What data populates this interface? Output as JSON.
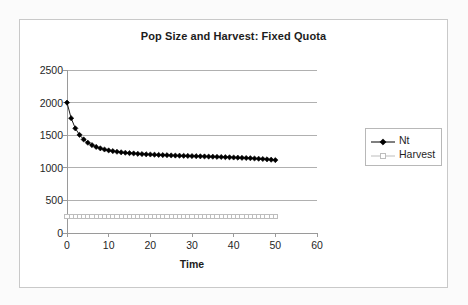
{
  "chart_data": {
    "type": "line",
    "title": "Pop Size and Harvest: Fixed Quota",
    "xlabel": "Time",
    "ylabel": "",
    "xlim": [
      0,
      60
    ],
    "ylim": [
      0,
      2500
    ],
    "xticks": [
      0,
      10,
      20,
      30,
      40,
      50,
      60
    ],
    "yticks": [
      0,
      500,
      1000,
      1500,
      2000,
      2500
    ],
    "grid": "horizontal",
    "legend_position": "right",
    "x": [
      0,
      1,
      2,
      3,
      4,
      5,
      6,
      7,
      8,
      9,
      10,
      11,
      12,
      13,
      14,
      15,
      16,
      17,
      18,
      19,
      20,
      21,
      22,
      23,
      24,
      25,
      26,
      27,
      28,
      29,
      30,
      31,
      32,
      33,
      34,
      35,
      36,
      37,
      38,
      39,
      40,
      41,
      42,
      43,
      44,
      45,
      46,
      47,
      48,
      49,
      50
    ],
    "series": [
      {
        "name": "Nt",
        "marker": "filled-diamond",
        "color": "#000000",
        "values": [
          2000,
          1760,
          1605,
          1505,
          1435,
          1385,
          1348,
          1320,
          1298,
          1281,
          1267,
          1256,
          1246,
          1238,
          1231,
          1225,
          1220,
          1215,
          1211,
          1207,
          1204,
          1201,
          1198,
          1195,
          1193,
          1190,
          1188,
          1186,
          1184,
          1182,
          1180,
          1178,
          1176,
          1174,
          1172,
          1170,
          1168,
          1166,
          1163,
          1161,
          1158,
          1156,
          1153,
          1150,
          1147,
          1143,
          1139,
          1135,
          1130,
          1124,
          1118
        ]
      },
      {
        "name": "Harvest",
        "marker": "open-square",
        "color": "#bdbdbd",
        "values": [
          250,
          250,
          250,
          250,
          250,
          250,
          250,
          250,
          250,
          250,
          250,
          250,
          250,
          250,
          250,
          250,
          250,
          250,
          250,
          250,
          250,
          250,
          250,
          250,
          250,
          250,
          250,
          250,
          250,
          250,
          250,
          250,
          250,
          250,
          250,
          250,
          250,
          250,
          250,
          250,
          250,
          250,
          250,
          250,
          250,
          250,
          250,
          250,
          250,
          250,
          250
        ]
      }
    ]
  },
  "legend": {
    "entries": [
      {
        "label": "Nt"
      },
      {
        "label": "Harvest"
      }
    ]
  },
  "colors": {
    "series_nt": "#000000",
    "series_harvest": "#bdbdbd",
    "gridline": "#b0b0b0",
    "axis": "#9a9a9a",
    "frame_border": "#c9c9c9",
    "text": "#1f1f1f",
    "page_background": "#fbfbfb",
    "plot_background": "#ffffff"
  }
}
